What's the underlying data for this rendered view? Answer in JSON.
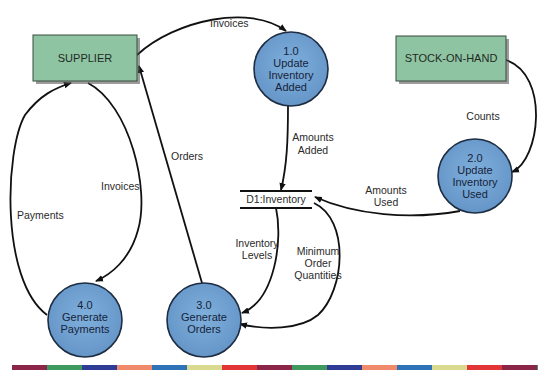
{
  "diagram": {
    "type": "data-flow-diagram",
    "colors": {
      "entity_fill": "#8fc4a2",
      "entity_border": "#3b4a3f",
      "process_fill": "#6f9fcf",
      "process_border": "#1d2d42",
      "line": "#111111"
    },
    "entities": [
      {
        "id": "supplier",
        "label": "SUPPLIER"
      },
      {
        "id": "stock",
        "label": "STOCK-ON-HAND"
      }
    ],
    "processes": [
      {
        "id": "p1",
        "number": "1.0",
        "line1": "Update",
        "line2": "Inventory",
        "line3": "Added"
      },
      {
        "id": "p2",
        "number": "2.0",
        "line1": "Update",
        "line2": "Inventory",
        "line3": "Used"
      },
      {
        "id": "p3",
        "number": "3.0",
        "line1": "Generate",
        "line2": "Orders"
      },
      {
        "id": "p4",
        "number": "4.0",
        "line1": "Generate",
        "line2": "Payments"
      }
    ],
    "data_store": {
      "id": "d1",
      "label": "D1:Inventory"
    },
    "flows": [
      {
        "from": "SUPPLIER",
        "to": "1.0",
        "label": "Invoices"
      },
      {
        "from": "STOCK-ON-HAND",
        "to": "2.0",
        "label": "Counts"
      },
      {
        "from": "1.0",
        "to": "D1:Inventory",
        "line1": "Amounts",
        "line2": "Added"
      },
      {
        "from": "2.0",
        "to": "D1:Inventory",
        "line1": "Amounts",
        "line2": "Used"
      },
      {
        "from": "D1:Inventory",
        "to": "3.0",
        "line1": "Inventory",
        "line2": "Levels"
      },
      {
        "from": "D1:Inventory",
        "to": "3.0",
        "line1": "Minimum",
        "line2": "Order",
        "line3": "Quantities"
      },
      {
        "from": "3.0",
        "to": "SUPPLIER",
        "label": "Orders"
      },
      {
        "from": "SUPPLIER",
        "to": "4.0",
        "label": "Invoices"
      },
      {
        "from": "4.0",
        "to": "SUPPLIER",
        "label": "Payments"
      }
    ]
  },
  "color_bar": [
    "#8b2648",
    "#3f9a5f",
    "#2e3c96",
    "#f08a6a",
    "#2e72b8",
    "#d9d98f",
    "#e23535",
    "#8b2648",
    "#3f9a5f",
    "#2e3c96",
    "#f08a6a",
    "#2e72b8",
    "#d9d98f",
    "#e23535",
    "#8b2648",
    "#3f9a5f"
  ]
}
